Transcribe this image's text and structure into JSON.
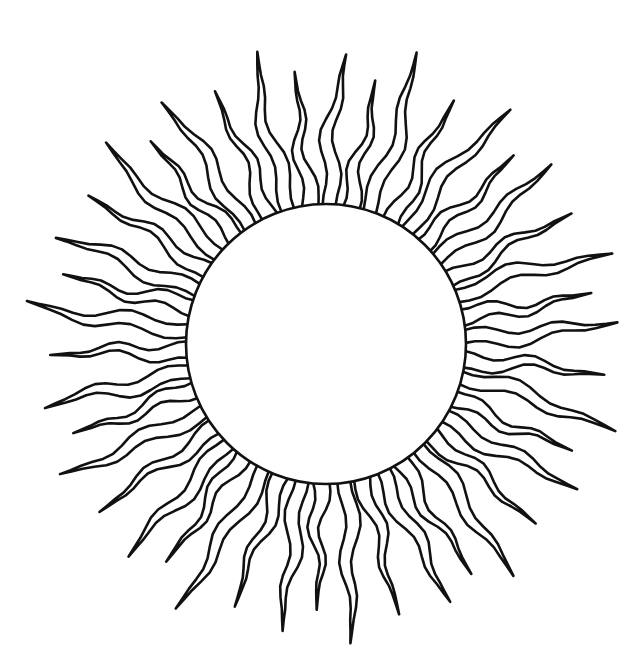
{
  "illustration": {
    "subject": "sun",
    "style": "black line art on white",
    "canvas": {
      "width": 640,
      "height": 654,
      "background": "#ffffff"
    },
    "stroke_color": "#111111",
    "fill_color": "#ffffff",
    "disc": {
      "cx": 326,
      "cy": 344,
      "r": 140
    },
    "rays": {
      "count": 42,
      "start_angle_deg": -88,
      "base_half_width_deg": 3.4,
      "lengths": [
        150,
        128,
        165,
        135,
        158,
        126,
        148,
        138,
        160,
        130,
        152,
        140,
        162,
        128,
        150,
        136,
        158,
        132,
        146,
        140,
        160,
        126,
        150,
        138,
        164,
        130,
        150,
        142,
        156,
        128,
        148,
        136,
        162,
        132,
        150,
        140,
        158,
        128,
        152,
        136,
        160,
        134
      ],
      "wave_amplitude": 7,
      "wave_cycles": 1.6,
      "hook_every": 2
    }
  }
}
